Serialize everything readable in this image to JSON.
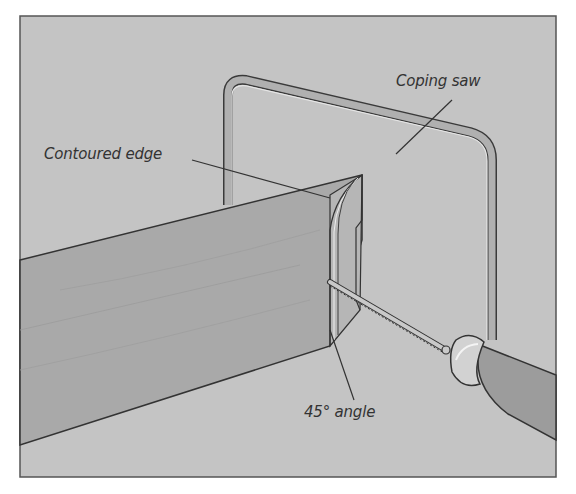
{
  "figure": {
    "colors": {
      "background": "#c4c4c4",
      "board": "#a9a9a9",
      "board_end": "#b4b4b4",
      "saw_frame": "#b0b0b0",
      "handle": "#9c9c9c",
      "ferrule": "#d2d2d2",
      "outline": "#3a3a3a",
      "text": "#333333"
    }
  },
  "labels": {
    "contoured_edge": "Contoured edge",
    "coping_saw": "Coping saw",
    "angle": "45° angle"
  }
}
